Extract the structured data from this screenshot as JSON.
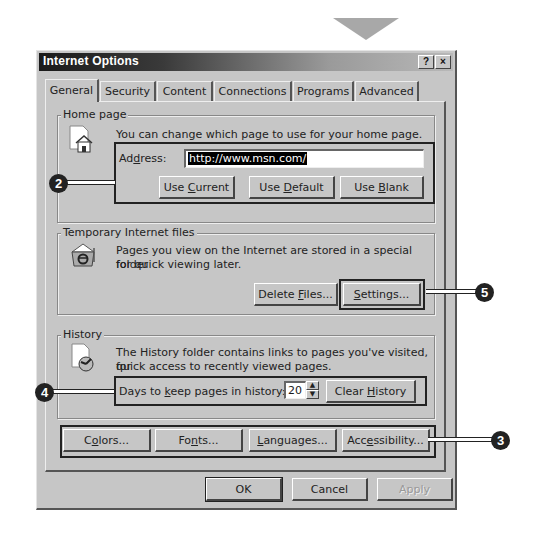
{
  "window": {
    "title": "Internet Options",
    "help_button": "?",
    "close_button": "×"
  },
  "tabs": [
    {
      "label": "General",
      "active": true
    },
    {
      "label": "Security",
      "active": false
    },
    {
      "label": "Content",
      "active": false
    },
    {
      "label": "Connections",
      "active": false
    },
    {
      "label": "Programs",
      "active": false
    },
    {
      "label": "Advanced",
      "active": false
    }
  ],
  "home_page": {
    "legend": "Home page",
    "description": "You can change which page to use for your home page.",
    "address_label_pre": "Ad",
    "address_label_ul": "d",
    "address_label_post": "ress:",
    "address_value": "http://www.msn.com/",
    "use_current": {
      "pre": "Use ",
      "ul": "C",
      "post": "urrent"
    },
    "use_default": {
      "pre": "Use ",
      "ul": "D",
      "post": "efault"
    },
    "use_blank": {
      "pre": "Use ",
      "ul": "B",
      "post": "lank"
    }
  },
  "temp_files": {
    "legend": "Temporary Internet files",
    "description_line1": "Pages you view on the Internet are stored in a special folder",
    "description_line2": "for quick viewing later.",
    "delete_files": {
      "pre": "Delete ",
      "ul": "F",
      "post": "iles..."
    },
    "settings": {
      "pre": "",
      "ul": "S",
      "post": "ettings..."
    }
  },
  "history": {
    "legend": "History",
    "description_line1": "The History folder contains links to pages you've visited, for",
    "description_line2": "quick access to recently viewed pages.",
    "days_label": {
      "pre": "Days to ",
      "ul": "k",
      "post": "eep pages in history:"
    },
    "days_value": "20",
    "clear_history": {
      "pre": "Clear ",
      "ul": "H",
      "post": "istory"
    }
  },
  "bottom_row": {
    "colors": {
      "pre": "C",
      "ul": "o",
      "post": "lors..."
    },
    "fonts": {
      "pre": "Fo",
      "ul": "n",
      "post": "ts..."
    },
    "languages": {
      "pre": "",
      "ul": "L",
      "post": "anguages..."
    },
    "accessibility": {
      "pre": "Acc",
      "ul": "e",
      "post": "ssibility..."
    }
  },
  "dialog_buttons": {
    "ok": "OK",
    "cancel": "Cancel",
    "apply": "Apply"
  },
  "callouts": [
    "2",
    "3",
    "4",
    "5"
  ],
  "colors": {
    "dialog_bg": "#c6c6c6",
    "titlebar_dark": "#1a1a1a",
    "highlight_border": "#222222",
    "callout_bg": "#222222"
  }
}
